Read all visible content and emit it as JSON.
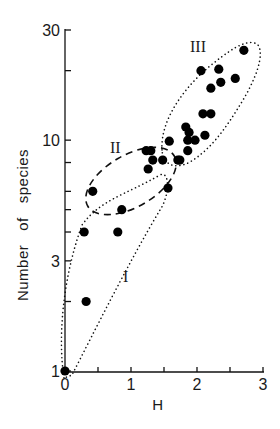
{
  "chart_data": {
    "type": "scatter",
    "title": "",
    "xlabel": "H",
    "ylabel": "Number   of   species",
    "xscale": "linear",
    "yscale": "log",
    "xlim": [
      0,
      3
    ],
    "ylim": [
      1,
      30
    ],
    "x_ticks": [
      0,
      0.5,
      1,
      1.5,
      2,
      2.5,
      3
    ],
    "x_tick_labels": [
      "0",
      "",
      "1",
      "",
      "2",
      "",
      "3"
    ],
    "y_ticks": [
      1,
      2,
      3,
      4,
      5,
      6,
      8,
      10,
      20,
      30
    ],
    "y_tick_labels": [
      "1",
      "",
      "3",
      "",
      "",
      "",
      "",
      "10",
      "",
      "30"
    ],
    "grid": false,
    "legend": null,
    "marker_color": "#000000",
    "series": [
      {
        "name": "points",
        "points": [
          {
            "x": 0.0,
            "y": 1.0
          },
          {
            "x": 0.32,
            "y": 2.0
          },
          {
            "x": 0.29,
            "y": 4.0
          },
          {
            "x": 0.8,
            "y": 4.0
          },
          {
            "x": 0.42,
            "y": 6.0
          },
          {
            "x": 0.86,
            "y": 5.0
          },
          {
            "x": 1.56,
            "y": 6.2
          },
          {
            "x": 1.26,
            "y": 7.5
          },
          {
            "x": 1.33,
            "y": 8.2
          },
          {
            "x": 1.48,
            "y": 8.2
          },
          {
            "x": 1.71,
            "y": 8.2
          },
          {
            "x": 1.74,
            "y": 8.2
          },
          {
            "x": 1.23,
            "y": 9.0
          },
          {
            "x": 1.3,
            "y": 9.0
          },
          {
            "x": 1.86,
            "y": 9.0
          },
          {
            "x": 1.58,
            "y": 9.9
          },
          {
            "x": 1.86,
            "y": 10.0
          },
          {
            "x": 1.97,
            "y": 10.0
          },
          {
            "x": 1.88,
            "y": 10.8
          },
          {
            "x": 2.12,
            "y": 10.5
          },
          {
            "x": 1.83,
            "y": 11.4
          },
          {
            "x": 2.09,
            "y": 13.0
          },
          {
            "x": 2.21,
            "y": 13.0
          },
          {
            "x": 2.21,
            "y": 16.8
          },
          {
            "x": 2.36,
            "y": 17.8
          },
          {
            "x": 2.06,
            "y": 20.0
          },
          {
            "x": 2.33,
            "y": 20.3
          },
          {
            "x": 2.58,
            "y": 18.5
          },
          {
            "x": 2.71,
            "y": 24.5
          }
        ]
      }
    ],
    "annotations": [
      {
        "text": "I",
        "x": 0.95,
        "y": 2.6,
        "note": "dotted envelope around low-H points"
      },
      {
        "text": "II",
        "x": 0.8,
        "y": 9.3,
        "note": "dashed ellipse"
      },
      {
        "text": "III",
        "x": 2.0,
        "y": 26.0,
        "note": "dotted elongated envelope"
      }
    ]
  },
  "labels": {
    "x_axis_title": "H",
    "y_axis_title": "Number   of   species",
    "group_I": "I",
    "group_II": "II",
    "group_III": "III"
  }
}
